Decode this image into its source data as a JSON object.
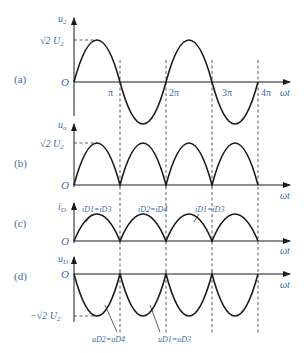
{
  "colors": {
    "label": "#3a6ea5",
    "curve": "#1a1a1a",
    "dash": "#333333"
  },
  "panels": [
    {
      "id": "a",
      "tag": "(a)",
      "ylabel": "u",
      "ylabel_sub": "2",
      "peak_label": "√2 U",
      "peak_sub": "2",
      "origin": "O",
      "xlabel": "ωt",
      "ticks": [
        "π",
        "2π",
        "3π",
        "4π"
      ],
      "waveform": "sine"
    },
    {
      "id": "b",
      "tag": "(b)",
      "ylabel": "u",
      "ylabel_sub": "o",
      "peak_label": "√2 U",
      "peak_sub": "2",
      "origin": "O",
      "xlabel": "ωt",
      "waveform": "full-wave rectified voltage"
    },
    {
      "id": "c",
      "tag": "(c)",
      "ylabel": "i",
      "ylabel_sub": "D",
      "origin": "O",
      "xlabel": "ωt",
      "waveform": "diode current",
      "annotations": [
        "iD1=iD3",
        "iD2=iD4",
        "iD1=iD3"
      ]
    },
    {
      "id": "d",
      "tag": "(d)",
      "ylabel": "u",
      "ylabel_sub": "D",
      "trough_label": "−√2 U",
      "trough_sub": "2",
      "origin": "O",
      "xlabel": "ωt",
      "waveform": "diode reverse voltage",
      "annotations": [
        "uD2=uD4",
        "uD1=uD3"
      ]
    }
  ]
}
